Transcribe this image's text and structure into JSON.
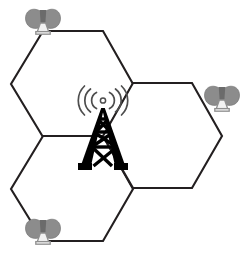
{
  "figure": {
    "title": "Cellular network cell cluster diagram",
    "caption": "Three hexagonal radio cells with a central transmission tower and three edge antennas",
    "width": 240,
    "height": 253,
    "background_color": "#ffffff"
  },
  "colors": {
    "hexagon_stroke": "#231f20",
    "tower_fill": "#000000",
    "signal_wave": "#4d4d4d",
    "antenna_wing": "#8c8c8c",
    "antenna_mast_fill": "#f2f2f2",
    "antenna_mast_stroke": "#8f8f8f",
    "page_background": "#ffffff"
  },
  "diagram": {
    "type": "hexagonal-cell-layout",
    "hexagon_count": 3,
    "tower_count": 1,
    "antenna_count": 3,
    "hexagons": [
      {
        "id": "cell-top-left",
        "label": "Top left cell",
        "center_x": 72,
        "center_y": 84,
        "radius": 61,
        "orientation": "pointy-side",
        "points": "43,31 103,31 133,84 103,137 43,137 11,84"
      },
      {
        "id": "cell-bottom-left",
        "label": "Bottom left cell",
        "center_x": 72,
        "center_y": 189,
        "radius": 61,
        "orientation": "pointy-side",
        "points": "43,136 103,136 133,189 103,241 43,241 11,189"
      },
      {
        "id": "cell-right",
        "label": "Right cell",
        "center_x": 162,
        "center_y": 136,
        "radius": 61,
        "orientation": "pointy-side",
        "points": "133,83 192,83 222,136 192,188 133,188 103,136"
      }
    ],
    "tower": {
      "id": "central-transmission-tower",
      "label": "Central transmission tower",
      "x": 103,
      "y": 137,
      "height": 62,
      "base_width": 50,
      "has_signal_waves": true,
      "signal_wave_rings": 3,
      "signal_wave_sides": 2
    },
    "antennas": [
      {
        "id": "antenna-top-left",
        "label": "Top left antenna",
        "x": 43,
        "y": 31,
        "vertex": "top-left-cell-upper-left"
      },
      {
        "id": "antenna-right",
        "label": "Right antenna",
        "x": 222,
        "y": 136,
        "vertex": "right-cell-right"
      },
      {
        "id": "antenna-bottom-left",
        "label": "Bottom left antenna",
        "x": 43,
        "y": 241,
        "vertex": "bottom-left-cell-lower-left"
      }
    ]
  }
}
